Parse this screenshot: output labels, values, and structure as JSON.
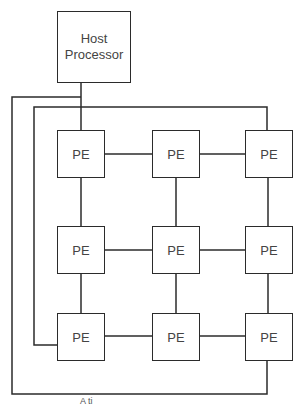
{
  "diagram": {
    "type": "mesh-array",
    "host": {
      "label_line1": "Host",
      "label_line2": "Processor"
    },
    "pe_label": "PE",
    "grid": {
      "rows": 3,
      "cols": 3,
      "cells": [
        [
          "PE",
          "PE",
          "PE"
        ],
        [
          "PE",
          "PE",
          "PE"
        ],
        [
          "PE",
          "PE",
          "PE"
        ]
      ]
    },
    "caption": "A    ti",
    "colors": {
      "line": "#2b2b2b",
      "text": "#444444",
      "background": "#ffffff"
    }
  }
}
